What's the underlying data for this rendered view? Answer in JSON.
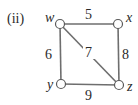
{
  "figure": {
    "label": "(ii)"
  },
  "graph": {
    "vertices": [
      {
        "id": "w",
        "label": "w"
      },
      {
        "id": "x",
        "label": "x"
      },
      {
        "id": "y",
        "label": "y"
      },
      {
        "id": "z",
        "label": "z"
      }
    ],
    "edges": [
      {
        "from": "w",
        "to": "x",
        "weight": "5"
      },
      {
        "from": "w",
        "to": "y",
        "weight": "6"
      },
      {
        "from": "w",
        "to": "z",
        "weight": "7"
      },
      {
        "from": "x",
        "to": "z",
        "weight": "8"
      },
      {
        "from": "y",
        "to": "z",
        "weight": "9"
      }
    ]
  },
  "colors": {
    "edge": "#6e6e6e",
    "node_stroke": "#5a5a5a",
    "text": "#2a2a2a"
  }
}
